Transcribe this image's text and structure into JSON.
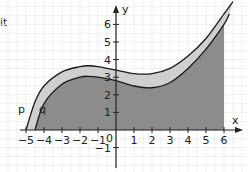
{
  "chart_data": {
    "type": "area",
    "title": "",
    "xlabel": "x",
    "ylabel": "y",
    "xlim": [
      -5,
      6
    ],
    "ylim": [
      -1,
      6
    ],
    "grid": true,
    "x_ticks": [
      -5,
      -4,
      -3,
      -2,
      -1,
      1,
      2,
      3,
      4,
      5,
      6
    ],
    "x_tick_labels": [
      "−5",
      "−4",
      "−3",
      "−2",
      "−1",
      "1",
      "2",
      "3",
      "4",
      "5",
      "6"
    ],
    "y_ticks": [
      -1,
      1,
      2,
      3,
      4,
      5,
      6
    ],
    "y_tick_labels": [
      "−1",
      "1",
      "2",
      "3",
      "4",
      "5",
      "6"
    ],
    "origin_label": "0",
    "series": [
      {
        "name": "p",
        "x": [
          -5,
          -4.5,
          -4,
          -3,
          -2,
          -1.5,
          -1,
          0,
          1,
          2,
          3,
          4,
          5,
          6,
          6.5
        ],
        "values": [
          0,
          1.6,
          2.5,
          3.3,
          3.6,
          3.65,
          3.6,
          3.4,
          3.2,
          3.2,
          3.5,
          4.2,
          5.2,
          6.6,
          7.3
        ]
      },
      {
        "name": "q",
        "x": [
          -4.5,
          -4,
          -3,
          -2,
          -1.5,
          -1,
          0,
          1,
          2,
          3,
          4,
          5,
          6,
          6.3
        ],
        "values": [
          0,
          1.5,
          2.6,
          3.0,
          3.05,
          3.0,
          2.8,
          2.5,
          2.4,
          2.7,
          3.5,
          4.6,
          6.0,
          6.6
        ]
      }
    ],
    "fills": [
      {
        "name": "band-between-p-and-q",
        "color": "#cfcfcf"
      },
      {
        "name": "area-under-q",
        "from_x": -4.5,
        "to_x": 6,
        "color": "#8c8c8c"
      }
    ],
    "annotations": [
      "p",
      "q"
    ]
  },
  "clipped_text": "it"
}
